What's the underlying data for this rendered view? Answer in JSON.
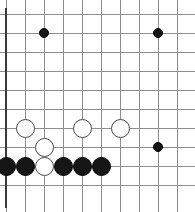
{
  "board": {
    "name": "go-board",
    "type": "go-goban",
    "columns": 10,
    "rows": 10,
    "cell_size": 19,
    "origin_x": 6,
    "origin_y": 14,
    "line_color": "#8d8d8d",
    "edge_color": "#3a3a3a",
    "background_color": "#ffffff",
    "black_color": "#161616",
    "white_color": "#ffffff",
    "white_border_color": "#4a4a4a",
    "stone_diameter": 19,
    "small_stone_diameter": 10
  },
  "stones": [
    {
      "id": "stone-1",
      "color": "black",
      "col": 3,
      "row": 2,
      "size": "small",
      "label": "black-stone-c3-r2"
    },
    {
      "id": "stone-2",
      "color": "black",
      "col": 9,
      "row": 2,
      "size": "small",
      "label": "black-stone-c9-r2"
    },
    {
      "id": "stone-3",
      "color": "white",
      "col": 2,
      "row": 7,
      "size": "large",
      "label": "white-stone-c2-r7"
    },
    {
      "id": "stone-4",
      "color": "white",
      "col": 5,
      "row": 7,
      "size": "large",
      "label": "white-stone-c5-r7"
    },
    {
      "id": "stone-5",
      "color": "white",
      "col": 7,
      "row": 7,
      "size": "large",
      "label": "white-stone-c7-r7"
    },
    {
      "id": "stone-6",
      "color": "white",
      "col": 3,
      "row": 8,
      "size": "large",
      "label": "white-stone-c3-r8"
    },
    {
      "id": "stone-7",
      "color": "black",
      "col": 9,
      "row": 8,
      "size": "small",
      "label": "black-stone-c9-r8"
    },
    {
      "id": "stone-8",
      "color": "black",
      "col": 1,
      "row": 9,
      "size": "large",
      "label": "black-stone-c1-r9"
    },
    {
      "id": "stone-9",
      "color": "black",
      "col": 2,
      "row": 9,
      "size": "large",
      "label": "black-stone-c2-r9"
    },
    {
      "id": "stone-10",
      "color": "white",
      "col": 3,
      "row": 9,
      "size": "large",
      "label": "white-stone-c3-r9"
    },
    {
      "id": "stone-11",
      "color": "black",
      "col": 4,
      "row": 9,
      "size": "large",
      "label": "black-stone-c4-r9"
    },
    {
      "id": "stone-12",
      "color": "black",
      "col": 5,
      "row": 9,
      "size": "large",
      "label": "black-stone-c5-r9"
    },
    {
      "id": "stone-13",
      "color": "black",
      "col": 6,
      "row": 9,
      "size": "large",
      "label": "black-stone-c6-r9"
    }
  ]
}
